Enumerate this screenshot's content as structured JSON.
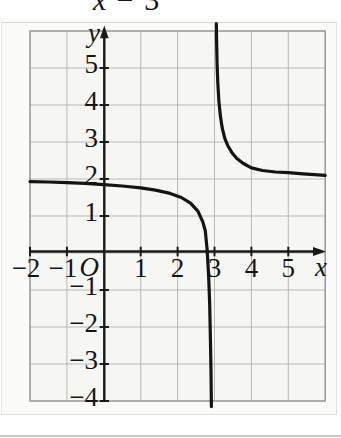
{
  "equation_fragment": {
    "variable": "x",
    "operator": " − ",
    "constant": "3"
  },
  "chart_data": {
    "type": "line",
    "title": "",
    "xlabel": "x",
    "ylabel": "y",
    "origin_label": "O",
    "xlim": [
      -2,
      6
    ],
    "ylim": [
      -4,
      6
    ],
    "grid": true,
    "grid_step": 1,
    "x_ticks": [
      {
        "v": -2,
        "label": "−2"
      },
      {
        "v": -1,
        "label": "−1"
      },
      {
        "v": 1,
        "label": "1"
      },
      {
        "v": 2,
        "label": "2"
      },
      {
        "v": 3,
        "label": "3"
      },
      {
        "v": 4,
        "label": "4"
      },
      {
        "v": 5,
        "label": "5"
      }
    ],
    "y_ticks": [
      {
        "v": 5,
        "label": "5"
      },
      {
        "v": 4,
        "label": "4"
      },
      {
        "v": 3,
        "label": "3"
      },
      {
        "v": 2,
        "label": "2"
      },
      {
        "v": 1,
        "label": "1"
      },
      {
        "v": -1,
        "label": "−1"
      },
      {
        "v": -2,
        "label": "−2"
      },
      {
        "v": -3,
        "label": "−3"
      },
      {
        "v": -4,
        "label": "−4"
      }
    ],
    "asymptotes": {
      "vertical_x": 3,
      "horizontal_y": 2
    },
    "series": [
      {
        "name": "left-branch",
        "points": [
          [
            -2,
            1.93
          ],
          [
            -1.5,
            1.92
          ],
          [
            -1,
            1.9
          ],
          [
            -0.5,
            1.88
          ],
          [
            0,
            1.85
          ],
          [
            0.5,
            1.81
          ],
          [
            1,
            1.76
          ],
          [
            1.4,
            1.7
          ],
          [
            1.8,
            1.61
          ],
          [
            2.1,
            1.5
          ],
          [
            2.35,
            1.35
          ],
          [
            2.55,
            1.13
          ],
          [
            2.68,
            0.85
          ],
          [
            2.75,
            0.6
          ],
          [
            2.8,
            0.1
          ],
          [
            2.84,
            -0.6
          ],
          [
            2.87,
            -1.4
          ],
          [
            2.89,
            -2.3
          ],
          [
            2.905,
            -3.2
          ],
          [
            2.915,
            -4.15
          ]
        ]
      },
      {
        "name": "right-branch",
        "points": [
          [
            3.05,
            6.2
          ],
          [
            3.06,
            5.6
          ],
          [
            3.07,
            5.1
          ],
          [
            3.09,
            4.6
          ],
          [
            3.12,
            4.1
          ],
          [
            3.16,
            3.7
          ],
          [
            3.21,
            3.38
          ],
          [
            3.28,
            3.1
          ],
          [
            3.36,
            2.9
          ],
          [
            3.47,
            2.72
          ],
          [
            3.6,
            2.56
          ],
          [
            3.78,
            2.42
          ],
          [
            4.0,
            2.3
          ],
          [
            4.3,
            2.23
          ],
          [
            4.65,
            2.19
          ],
          [
            5.0,
            2.17
          ],
          [
            5.4,
            2.14
          ],
          [
            5.7,
            2.12
          ],
          [
            6.0,
            2.1
          ]
        ]
      }
    ],
    "colors": {
      "curve": "#141414",
      "axis": "#1a1a1a",
      "grid": "#b9b9b5",
      "frame": "#8f8f8c",
      "grid_fill": "#f6f6f3",
      "label": "#151515"
    }
  }
}
